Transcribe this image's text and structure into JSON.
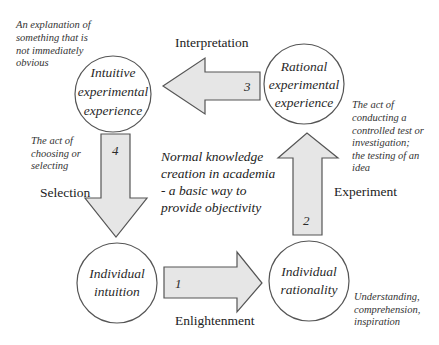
{
  "diagram": {
    "nodes": {
      "intuitive_experimental_experience": [
        "Intuitive",
        "experimental",
        "experience"
      ],
      "rational_experimental_experience": [
        "Rational",
        "experimental",
        "experience"
      ],
      "individual_intuition": [
        "Individual",
        "intuition"
      ],
      "individual_rationality": [
        "Individual",
        "rationality"
      ]
    },
    "arrows": {
      "arrow_1": {
        "number": "1",
        "label": "Enlightenment"
      },
      "arrow_2": {
        "number": "2",
        "label": "Experiment"
      },
      "arrow_3": {
        "number": "3",
        "label": "Interpretation"
      },
      "arrow_4": {
        "number": "4",
        "label": "Selection"
      }
    },
    "notes": {
      "interpretation": [
        "An explanation of",
        "something that is",
        "not immediately",
        "obvious"
      ],
      "experiment": [
        "The act of",
        "conducting a",
        "controlled test or",
        "investigation;",
        "the testing of an",
        "idea"
      ],
      "selection": [
        "The act of",
        "choosing or",
        "selecting"
      ],
      "enlightenment": [
        "Understanding,",
        "comprehension,",
        "inspiration"
      ]
    },
    "center": [
      "Normal knowledge",
      "creation in academia",
      "- a basic way to",
      "provide objectivity"
    ],
    "colors": {
      "arrow_fill": "#e6e6e6",
      "stroke": "#555555",
      "text": "#222222"
    }
  }
}
